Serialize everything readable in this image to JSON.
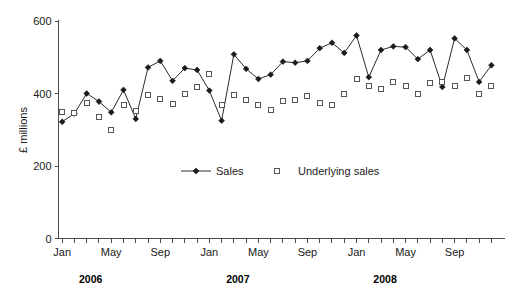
{
  "chart_data": {
    "type": "line",
    "title": "",
    "xlabel": "",
    "ylabel": "£ millions",
    "ylim": [
      0,
      600
    ],
    "yticks": [
      0,
      200,
      400,
      600
    ],
    "ytick_labels": [
      "0",
      "200",
      "400",
      "600"
    ],
    "grid": false,
    "legend_position": "inside-center",
    "x": [
      "Jan 2006",
      "Feb 2006",
      "Mar 2006",
      "Apr 2006",
      "May 2006",
      "Jun 2006",
      "Jul 2006",
      "Aug 2006",
      "Sep 2006",
      "Oct 2006",
      "Nov 2006",
      "Dec 2006",
      "Jan 2007",
      "Feb 2007",
      "Mar 2007",
      "Apr 2007",
      "May 2007",
      "Jun 2007",
      "Jul 2007",
      "Aug 2007",
      "Sep 2007",
      "Oct 2007",
      "Nov 2007",
      "Dec 2007",
      "Jan 2008",
      "Feb 2008",
      "Mar 2008",
      "Apr 2008",
      "May 2008",
      "Jun 2008",
      "Jul 2008",
      "Aug 2008",
      "Sep 2008",
      "Oct 2008",
      "Nov 2008",
      "Dec 2008"
    ],
    "xtick_labels": [
      "Jan",
      "May",
      "Sep",
      "Jan",
      "May",
      "Sep",
      "Jan",
      "May",
      "Sep"
    ],
    "xtick_indices": [
      0,
      4,
      8,
      12,
      16,
      20,
      24,
      28,
      32
    ],
    "year_labels": [
      "2006",
      "2007",
      "2008"
    ],
    "year_label_indices": [
      2,
      14,
      26
    ],
    "series": [
      {
        "name": "Sales",
        "marker": "filled-diamond",
        "line": true,
        "color": "#1a1a1a",
        "values": [
          322,
          345,
          400,
          378,
          348,
          410,
          330,
          472,
          490,
          435,
          470,
          465,
          408,
          325,
          508,
          468,
          440,
          452,
          488,
          485,
          490,
          525,
          540,
          512,
          560,
          445,
          520,
          530,
          528,
          495,
          520,
          418,
          552,
          520,
          432,
          478
        ]
      },
      {
        "name": "Underlying sales",
        "marker": "open-square",
        "line": false,
        "color": "#555555",
        "values": [
          348,
          345,
          375,
          335,
          298,
          368,
          352,
          395,
          385,
          372,
          398,
          418,
          455,
          368,
          395,
          382,
          368,
          355,
          378,
          382,
          392,
          375,
          368,
          398,
          440,
          420,
          412,
          432,
          420,
          400,
          430,
          432,
          420,
          442,
          400,
          420
        ]
      }
    ]
  },
  "legend": {
    "entries": [
      {
        "label": "Sales"
      },
      {
        "label": "Underlying sales"
      }
    ]
  },
  "axis": {
    "y_title": "£ millions"
  }
}
